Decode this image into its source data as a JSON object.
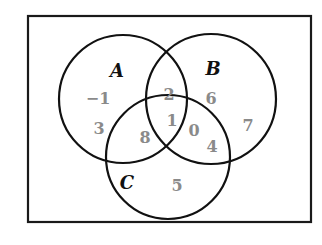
{
  "diagram": {
    "type": "venn-3",
    "frame": {
      "x": 28,
      "y": 16,
      "width": 283,
      "height": 206
    },
    "sets": [
      {
        "name": "A",
        "cx": 123,
        "cy": 99,
        "r": 64,
        "label_x": 117,
        "label_y": 77
      },
      {
        "name": "B",
        "cx": 211,
        "cy": 99,
        "r": 65,
        "label_x": 213,
        "label_y": 75
      },
      {
        "name": "C",
        "cx": 168,
        "cy": 157,
        "r": 62,
        "label_x": 127,
        "label_y": 189
      }
    ],
    "regions": [
      {
        "id": "A-only-1",
        "value": "−1",
        "x": 98,
        "y": 104
      },
      {
        "id": "A-only-2",
        "value": "3",
        "x": 99,
        "y": 134
      },
      {
        "id": "B-only-1",
        "value": "6",
        "x": 211,
        "y": 104
      },
      {
        "id": "B-only-2",
        "value": "7",
        "x": 248,
        "y": 131
      },
      {
        "id": "A-B-only",
        "value": "2",
        "x": 169,
        "y": 100
      },
      {
        "id": "A-B-C",
        "value": "1",
        "x": 172,
        "y": 126
      },
      {
        "id": "A-C-only",
        "value": "8",
        "x": 145,
        "y": 143
      },
      {
        "id": "B-C-only-1",
        "value": "0",
        "x": 194,
        "y": 136
      },
      {
        "id": "B-C-only-2",
        "value": "4",
        "x": 212,
        "y": 152
      },
      {
        "id": "C-only",
        "value": "5",
        "x": 177,
        "y": 191
      }
    ],
    "colors": {
      "outline": "#111111",
      "values": "#8a8a8a",
      "labels": "#111111",
      "background": "#ffffff"
    }
  }
}
